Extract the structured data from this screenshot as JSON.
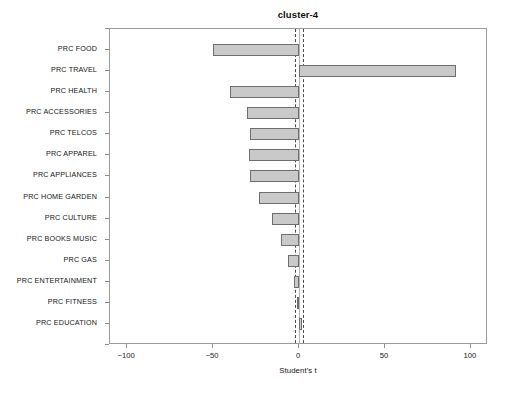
{
  "chart_data": {
    "type": "bar",
    "orientation": "horizontal",
    "title": "cluster-4",
    "xlabel": "Student's t",
    "ylabel": "",
    "xlim": [
      -110,
      110
    ],
    "ylim": [
      0,
      15
    ],
    "grid": false,
    "legend": null,
    "xticks": [
      -100,
      -50,
      0,
      50,
      100
    ],
    "xticklabels": [
      "−100",
      "−50",
      "0",
      "50",
      "100"
    ],
    "categories": [
      "PRC FOOD",
      "PRC TRAVEL",
      "PRC HEALTH",
      "PRC ACCESSORIES",
      "PRC TELCOS",
      "PRC APPAREL",
      "PRC APPLIANCES",
      "PRC HOME GARDEN",
      "PRC CULTURE",
      "PRC BOOKS MUSIC",
      "PRC GAS",
      "PRC ENTERTAINMENT",
      "PRC FITNESS",
      "PRC EDUCATION"
    ],
    "values": [
      -50.3,
      91.4,
      -40.1,
      -30.0,
      -28.4,
      -28.9,
      -28.4,
      -23.0,
      -15.5,
      -10.7,
      -6.4,
      -2.7,
      -1.1,
      1.6
    ],
    "reference_lines": [
      {
        "value": 0,
        "style": "solid",
        "color": "#b4b4b4"
      },
      {
        "value": -2.6,
        "style": "dashed",
        "color": "#4a4a4a"
      },
      {
        "value": 2.2,
        "style": "dashed",
        "color": "#4a4a4a"
      }
    ],
    "bar_color": "#c9c9c9",
    "bar_edge_color": "#6e6e6e"
  }
}
